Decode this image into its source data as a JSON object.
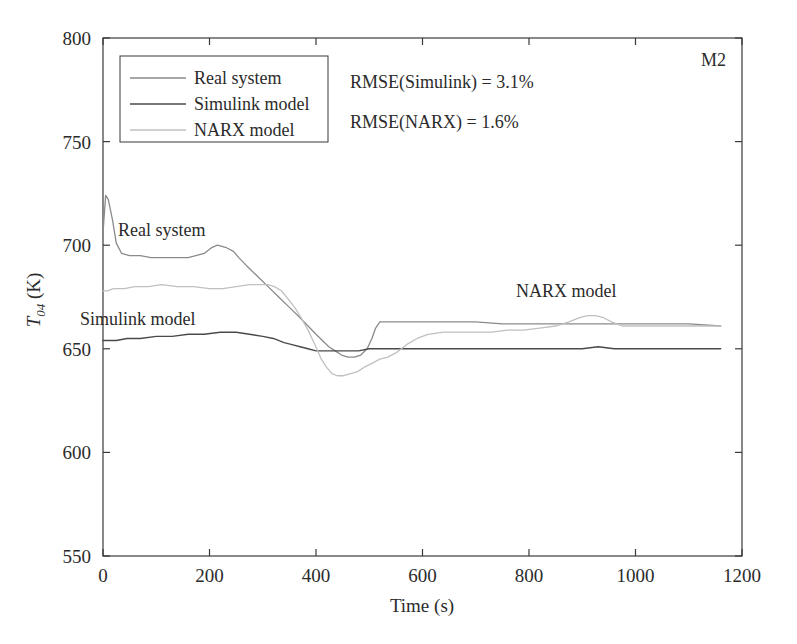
{
  "figure": {
    "corner_label": "M2",
    "background": "#ffffff"
  },
  "annotations": {
    "rmse_simulink": "RMSE(Simulink) = 3.1%",
    "rmse_narx": "RMSE(NARX) = 1.6%",
    "curve_real": "Real system",
    "curve_simulink": "Simulink model",
    "curve_narx": "NARX model"
  },
  "legend": {
    "position": "upper-left",
    "items": [
      {
        "label": "Real system",
        "color": "#8a8a8a"
      },
      {
        "label": "Simulink model",
        "color": "#4a4a4a"
      },
      {
        "label": "NARX model",
        "color": "#c0c0c0"
      }
    ]
  },
  "axis": {
    "x_label": "Time (s)",
    "y_label_main": "T",
    "y_label_sub": "04",
    "y_label_unit": " (K)",
    "x_ticks": [
      "0",
      "200",
      "400",
      "600",
      "800",
      "1000",
      "1200"
    ],
    "y_ticks": [
      "550",
      "600",
      "650",
      "700",
      "750",
      "800"
    ]
  },
  "chart_data": {
    "type": "line",
    "title": "",
    "xlabel": "Time (s)",
    "ylabel": "T_04 (K)",
    "xlim": [
      0,
      1200
    ],
    "ylim": [
      550,
      800
    ],
    "xticks": [
      0,
      200,
      400,
      600,
      800,
      1000,
      1200
    ],
    "yticks": [
      550,
      600,
      650,
      700,
      750,
      800
    ],
    "grid": false,
    "legend_position": "upper-left",
    "annotations": [
      {
        "text": "M2",
        "x": 1150,
        "y": 790
      },
      {
        "text": "RMSE(Simulink) = 3.1%",
        "x": 430,
        "y": 775
      },
      {
        "text": "RMSE(NARX) = 1.6%",
        "x": 430,
        "y": 750
      },
      {
        "text": "Real system",
        "x": 130,
        "y": 712
      },
      {
        "text": "Simulink model",
        "x": 40,
        "y": 668
      },
      {
        "text": "NARX model",
        "x": 830,
        "y": 680
      }
    ],
    "series": [
      {
        "name": "Real system",
        "color": "#8a8a8a",
        "x": [
          0,
          5,
          10,
          18,
          25,
          35,
          50,
          70,
          90,
          110,
          130,
          160,
          190,
          205,
          215,
          230,
          245,
          255,
          270,
          290,
          310,
          330,
          350,
          370,
          385,
          400,
          412,
          424,
          436,
          448,
          460,
          472,
          484,
          496,
          505,
          512,
          520,
          530,
          545,
          570,
          600,
          650,
          700,
          750,
          800,
          850,
          900,
          950,
          1000,
          1050,
          1100,
          1160
        ],
        "y": [
          706,
          724,
          722,
          712,
          701,
          696,
          695,
          695,
          694,
          694,
          694,
          694,
          696,
          699,
          700,
          699,
          697,
          694,
          690,
          685,
          680,
          675,
          670,
          665,
          661,
          657,
          654,
          651,
          649,
          647,
          646,
          646,
          647,
          650,
          655,
          660,
          663,
          663,
          663,
          663,
          663,
          663,
          663,
          662,
          662,
          662,
          662,
          662,
          662,
          662,
          662,
          661
        ]
      },
      {
        "name": "Simulink model",
        "color": "#4a4a4a",
        "x": [
          0,
          10,
          25,
          45,
          70,
          100,
          130,
          160,
          190,
          220,
          250,
          275,
          300,
          320,
          340,
          355,
          370,
          385,
          400,
          415,
          430,
          445,
          460,
          480,
          500,
          520,
          545,
          570,
          600,
          650,
          700,
          750,
          800,
          850,
          900,
          930,
          960,
          1000,
          1050,
          1100,
          1160
        ],
        "y": [
          654,
          654,
          654,
          655,
          655,
          656,
          656,
          657,
          657,
          658,
          658,
          657,
          656,
          655,
          653,
          652,
          651,
          650,
          649,
          649,
          649,
          649,
          649,
          649,
          650,
          650,
          650,
          650,
          650,
          650,
          650,
          650,
          650,
          650,
          650,
          651,
          650,
          650,
          650,
          650,
          650
        ]
      },
      {
        "name": "NARX model",
        "color": "#c0c0c0",
        "x": [
          0,
          8,
          20,
          40,
          60,
          85,
          110,
          140,
          170,
          200,
          225,
          250,
          275,
          295,
          310,
          322,
          335,
          348,
          360,
          372,
          385,
          398,
          410,
          420,
          430,
          440,
          452,
          465,
          478,
          490,
          505,
          520,
          535,
          550,
          570,
          590,
          610,
          640,
          670,
          700,
          730,
          760,
          790,
          820,
          850,
          875,
          895,
          910,
          925,
          940,
          955,
          975,
          1000,
          1040,
          1080,
          1120,
          1160
        ],
        "y": [
          678,
          678,
          679,
          679,
          680,
          680,
          681,
          680,
          680,
          679,
          679,
          680,
          681,
          681,
          681,
          680,
          678,
          674,
          670,
          665,
          659,
          652,
          645,
          641,
          638,
          637,
          637,
          638,
          639,
          641,
          643,
          645,
          646,
          648,
          652,
          655,
          657,
          658,
          658,
          658,
          658,
          659,
          659,
          660,
          661,
          663,
          665,
          666,
          666,
          665,
          663,
          661,
          661,
          661,
          661,
          661,
          661
        ]
      }
    ]
  }
}
